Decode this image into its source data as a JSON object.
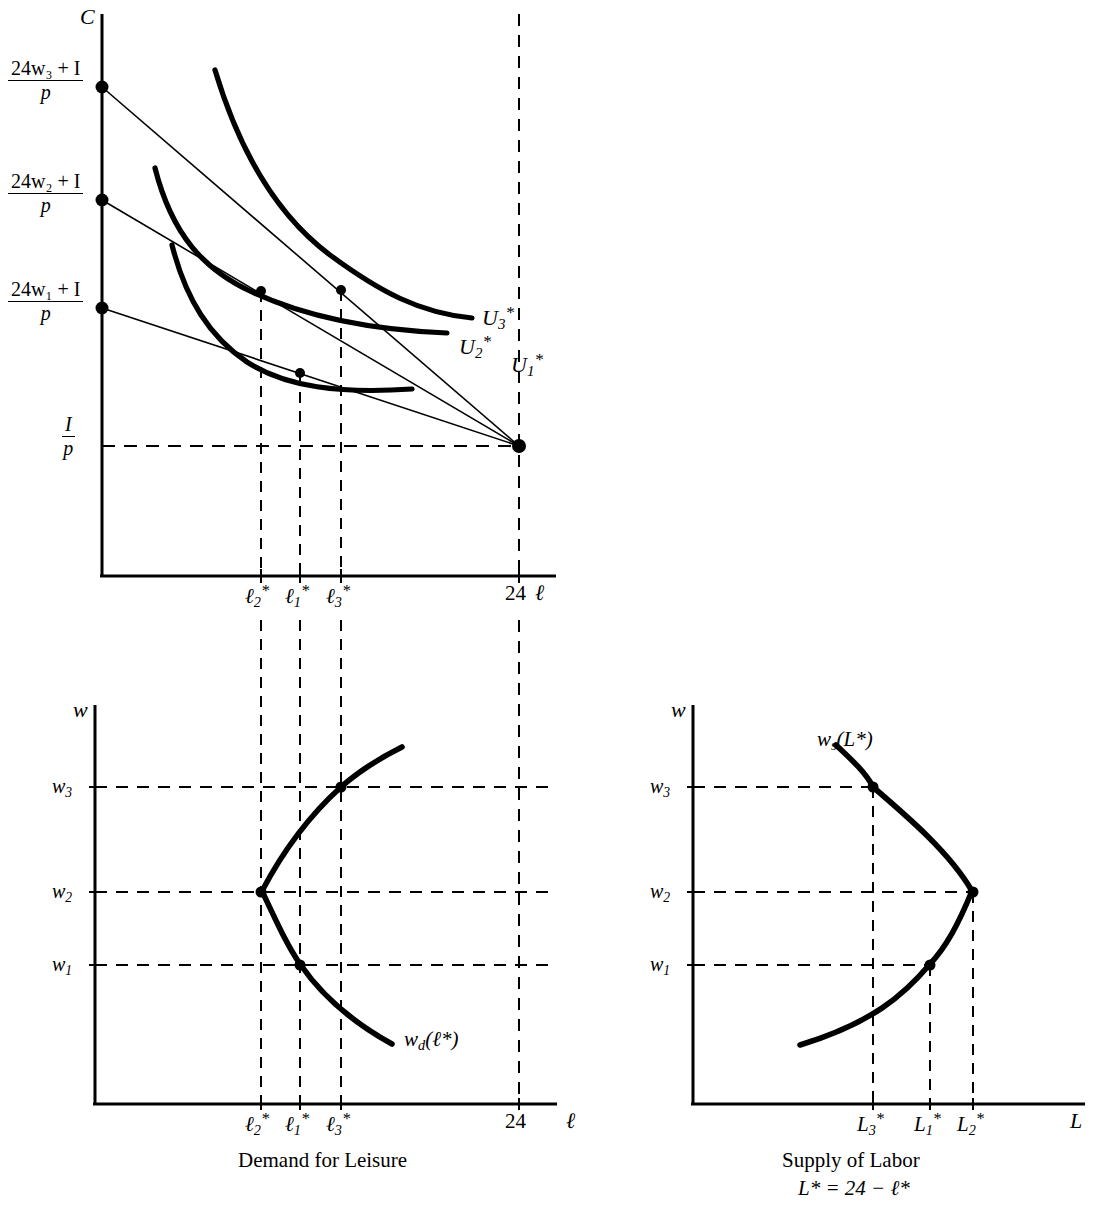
{
  "figure": {
    "panels": [
      "consumption-leisure-choice",
      "demand-for-leisure",
      "supply-of-labor"
    ]
  },
  "panel_top": {
    "name": "consumption-leisure-choice",
    "y_axis_label": "C",
    "x_axis_label": "ℓ",
    "y_tick_labels": [
      {
        "num": "24w₃ + I",
        "den": "p"
      },
      {
        "num": "24w₂ + I",
        "den": "p"
      },
      {
        "num": "24w₁ + I",
        "den": "p"
      },
      {
        "num": "I",
        "den": "p"
      }
    ],
    "y_tick_num_3": "24w",
    "x_tick_labels": [
      "ℓ2*",
      "ℓ1*",
      "ℓ3*",
      "24"
    ],
    "curve_labels": [
      "U3*",
      "U2*",
      "U1*"
    ],
    "endowment_hours": "24"
  },
  "panel_bottom_left": {
    "name": "demand-for-leisure",
    "y_axis_label": "w",
    "x_axis_label": "ℓ",
    "y_tick_labels": [
      "w3",
      "w2",
      "w1"
    ],
    "x_tick_labels": [
      "ℓ2*",
      "ℓ1*",
      "ℓ3*",
      "24"
    ],
    "curve_label": "wd(ℓ*)",
    "caption": "Demand for Leisure"
  },
  "panel_bottom_right": {
    "name": "supply-of-labor",
    "y_axis_label": "w",
    "x_axis_label": "L",
    "y_tick_labels": [
      "w3",
      "w2",
      "w1"
    ],
    "x_tick_labels": [
      "L3*",
      "L1*",
      "L2*"
    ],
    "curve_label": "ws(L*)",
    "caption": "Supply of Labor",
    "caption_formula": "L* = 24 − ℓ*"
  },
  "chart_data": {
    "type": "line",
    "panels": [
      {
        "id": "consumption-leisure-choice",
        "type": "line",
        "xlabel": "ℓ (leisure hours)",
        "ylabel": "C (consumption)",
        "xlim": [
          0,
          27
        ],
        "ylim": [
          0,
          1
        ],
        "grid": false,
        "legend": "inline-curve-labels",
        "series": [
          {
            "name": "Budget line w1",
            "type": "line",
            "points": [
              [
                0,
                0.566
              ],
              [
                24,
                0.226
              ]
            ]
          },
          {
            "name": "Budget line w2",
            "type": "line",
            "points": [
              [
                0,
                0.734
              ],
              [
                24,
                0.226
              ]
            ]
          },
          {
            "name": "Budget line w3",
            "type": "line",
            "points": [
              [
                0,
                0.902
              ],
              [
                24,
                0.226
              ]
            ]
          },
          {
            "name": "U1*",
            "type": "indifference-curve",
            "tangency": [
              9.0,
              0.444
            ]
          },
          {
            "name": "U2*",
            "type": "indifference-curve",
            "tangency": [
              7.1,
              0.568
            ]
          },
          {
            "name": "U3*",
            "type": "indifference-curve",
            "tangency": [
              11.1,
              0.568
            ]
          }
        ],
        "points": [
          {
            "label": "(24w1+I)/p",
            "x": 0,
            "y": 0.566
          },
          {
            "label": "(24w2+I)/p",
            "x": 0,
            "y": 0.734
          },
          {
            "label": "(24w3+I)/p",
            "x": 0,
            "y": 0.902
          },
          {
            "label": "I/p at 24",
            "x": 24,
            "y": 0.226
          },
          {
            "label": "tangency ℓ2*",
            "x": 7.1,
            "y": 0.568
          },
          {
            "label": "tangency ℓ1*",
            "x": 9.0,
            "y": 0.444
          },
          {
            "label": "tangency ℓ3*",
            "x": 11.1,
            "y": 0.568
          }
        ],
        "xticks": [
          7.1,
          9.0,
          11.1,
          24
        ],
        "xticklabels": [
          "ℓ2*",
          "ℓ1*",
          "ℓ3*",
          "24"
        ]
      },
      {
        "id": "demand-for-leisure",
        "type": "line",
        "xlabel": "ℓ",
        "ylabel": "w",
        "grid": false,
        "series": [
          {
            "name": "wd(ℓ*)",
            "type": "backward-bending",
            "points": [
              [
                11.9,
                1.3
              ],
              [
                11.1,
                1.0
              ],
              [
                8.8,
                0.72
              ],
              [
                7.1,
                0.5
              ],
              [
                7.6,
                0.35
              ],
              [
                9.0,
                0.25
              ],
              [
                10.6,
                0.13
              ],
              [
                11.9,
                0.05
              ]
            ]
          }
        ],
        "points": [
          {
            "label": "(ℓ3*, w3)",
            "x": 11.1,
            "y": 1.0
          },
          {
            "label": "(ℓ2*, w2)",
            "x": 7.1,
            "y": 0.5
          },
          {
            "label": "(ℓ1*, w1)",
            "x": 9.0,
            "y": 0.25
          }
        ],
        "xticks": [
          7.1,
          9.0,
          11.1,
          24
        ],
        "xticklabels": [
          "ℓ2*",
          "ℓ1*",
          "ℓ3*",
          "24"
        ],
        "yticks": [
          0.25,
          0.5,
          1.0
        ],
        "yticklabels": [
          "w1",
          "w2",
          "w3"
        ]
      },
      {
        "id": "supply-of-labor",
        "type": "line",
        "xlabel": "L",
        "ylabel": "w",
        "grid": false,
        "series": [
          {
            "name": "ws(L*)",
            "type": "backward-bending",
            "points": [
              [
                12.1,
                1.3
              ],
              [
                12.9,
                1.0
              ],
              [
                15.2,
                0.72
              ],
              [
                16.9,
                0.5
              ],
              [
                16.4,
                0.35
              ],
              [
                15.0,
                0.25
              ],
              [
                13.4,
                0.13
              ],
              [
                12.1,
                0.05
              ]
            ]
          }
        ],
        "points": [
          {
            "label": "(L3*, w3)",
            "x": 12.9,
            "y": 1.0
          },
          {
            "label": "(L2*, w2)",
            "x": 16.9,
            "y": 0.5
          },
          {
            "label": "(L1*, w1)",
            "x": 15.0,
            "y": 0.25
          }
        ],
        "xticks": [
          12.9,
          15.0,
          16.9
        ],
        "xticklabels": [
          "L3*",
          "L1*",
          "L2*"
        ],
        "yticks": [
          0.25,
          0.5,
          1.0
        ],
        "yticklabels": [
          "w1",
          "w2",
          "w3"
        ]
      }
    ]
  }
}
